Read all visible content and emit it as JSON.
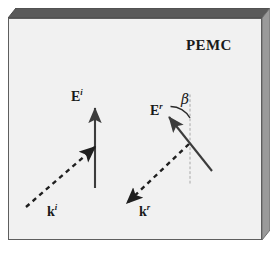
{
  "figure": {
    "background_color": "#ffffff",
    "slab": {
      "name": "PEMC slab",
      "face_color": "#f2f2f2",
      "edge_color": "#6e6e6e",
      "top_edge_color": "#4a4a4a",
      "border_color": "#555555",
      "label": "PEMC"
    },
    "labels": {
      "pemc": "PEMC",
      "E_incident_base": "E",
      "E_incident_sup": "i",
      "E_reflected_base": "E",
      "E_reflected_sup": "r",
      "k_incident_base": "k",
      "k_incident_sup": "i",
      "k_reflected_base": "k",
      "k_reflected_sup": "r",
      "beta": "β"
    },
    "colors": {
      "vector_solid": "#3c3c3c",
      "vector_dashed": "#1f1f1f",
      "normal_line": "#bdbdbd",
      "text": "#1a1a1a",
      "arc": "#2a2a2a"
    },
    "vectors": [
      {
        "name": "E-incident-arrow",
        "style": "solid",
        "label": "E^i",
        "from": [
          95,
          187
        ],
        "to": [
          95,
          106
        ],
        "description": "incident electric field, vertical, pointing up"
      },
      {
        "name": "k-incident-arrow",
        "style": "dashed",
        "label": "k^i",
        "from": [
          27,
          206
        ],
        "to": [
          97,
          145
        ],
        "description": "incident wave vector, pointing up-right toward boundary"
      },
      {
        "name": "E-reflected-arrow",
        "style": "solid",
        "label": "E^r",
        "from": [
          211,
          170
        ],
        "to": [
          168,
          115
        ],
        "description": "reflected electric field, pointing up-left"
      },
      {
        "name": "k-reflected-arrow",
        "style": "dashed",
        "label": "k^r",
        "from": [
          188,
          145
        ],
        "to": [
          125,
          204
        ],
        "description": "reflected wave vector, pointing down-left"
      }
    ],
    "normal_line": {
      "name": "surface-normal",
      "style": "dotted",
      "from": [
        190,
        95
      ],
      "to": [
        190,
        185
      ]
    },
    "angle": {
      "name": "beta-angle",
      "symbol": "β",
      "between": [
        "surface-normal",
        "E-reflected-arrow"
      ],
      "arc_center": [
        190,
        118
      ],
      "arc_radius": 22
    }
  }
}
